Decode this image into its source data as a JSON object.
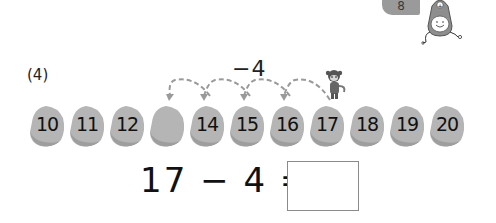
{
  "page_tag": {
    "number": "8",
    "color": "#9a9a9a"
  },
  "mascot": {
    "icon": "plus-mascot-icon",
    "symbol": "+"
  },
  "problem": {
    "label": "(4)",
    "operation": "−4",
    "arc_count": 4,
    "arc_color": "#9a9a9a",
    "start_number": "17",
    "character_icon": "monkey-icon"
  },
  "number_line": {
    "rock_color": "#b5b5b5",
    "rock_shade": "#9e9e9e",
    "rocks": [
      {
        "value": "10"
      },
      {
        "value": "11"
      },
      {
        "value": "12"
      },
      {
        "value": ""
      },
      {
        "value": "14"
      },
      {
        "value": "15"
      },
      {
        "value": "16"
      },
      {
        "value": "17"
      },
      {
        "value": "18"
      },
      {
        "value": "19"
      },
      {
        "value": "20"
      }
    ]
  },
  "equation": {
    "left": "17",
    "operator": "−",
    "right": "4",
    "equals": "=",
    "answer": ""
  }
}
